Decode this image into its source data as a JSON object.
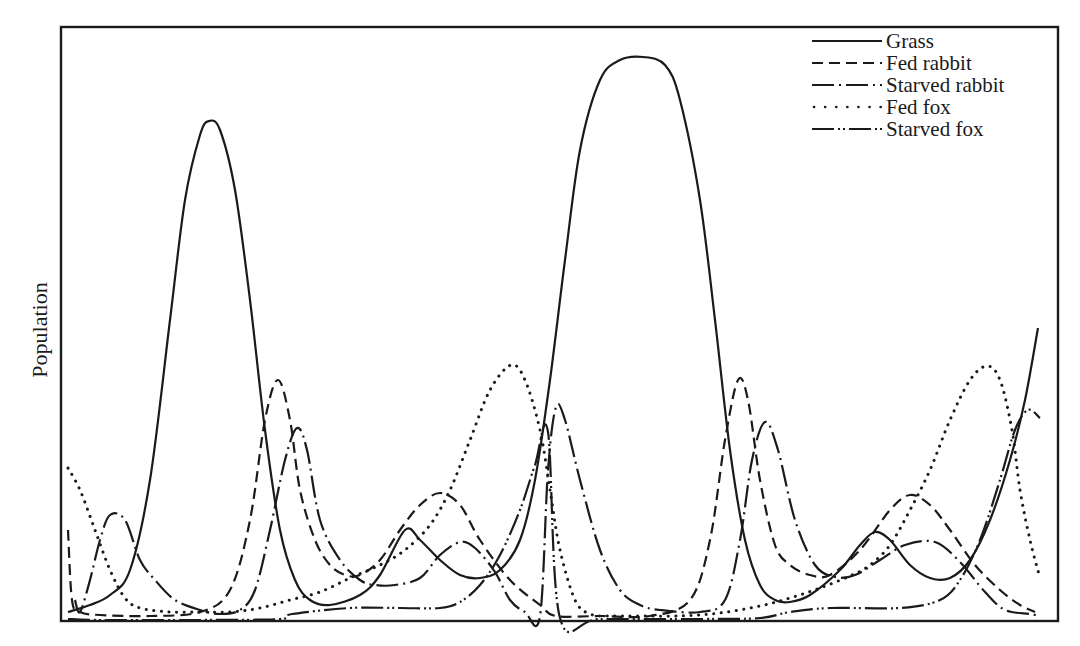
{
  "chart_data": {
    "type": "line",
    "title": "",
    "xlabel": "",
    "ylabel": "Population",
    "grid": false,
    "legend_position": "top-right",
    "frame_px": {
      "left": 61,
      "top": 27,
      "right": 1058,
      "bottom": 621
    },
    "baseline_px": 617,
    "note": "Points are [x_px, y_px] in image coordinates; population ∝ (617 - y_px). No axis ticks shown.",
    "series": [
      {
        "name": "Grass",
        "style": "solid",
        "points": [
          [
            68,
            612
          ],
          [
            90,
            605
          ],
          [
            110,
            595
          ],
          [
            130,
            570
          ],
          [
            150,
            480
          ],
          [
            170,
            320
          ],
          [
            185,
            200
          ],
          [
            200,
            135
          ],
          [
            209,
            121
          ],
          [
            220,
            130
          ],
          [
            235,
            190
          ],
          [
            250,
            300
          ],
          [
            265,
            430
          ],
          [
            280,
            530
          ],
          [
            295,
            580
          ],
          [
            310,
            600
          ],
          [
            330,
            605
          ],
          [
            360,
            595
          ],
          [
            380,
            575
          ],
          [
            405,
            530
          ],
          [
            420,
            540
          ],
          [
            440,
            560
          ],
          [
            460,
            575
          ],
          [
            480,
            578
          ],
          [
            500,
            570
          ],
          [
            520,
            540
          ],
          [
            535,
            480
          ],
          [
            550,
            380
          ],
          [
            565,
            260
          ],
          [
            580,
            150
          ],
          [
            600,
            80
          ],
          [
            620,
            60
          ],
          [
            643,
            57
          ],
          [
            665,
            65
          ],
          [
            680,
            100
          ],
          [
            700,
            200
          ],
          [
            715,
            320
          ],
          [
            730,
            450
          ],
          [
            745,
            540
          ],
          [
            760,
            585
          ],
          [
            775,
            600
          ],
          [
            790,
            602
          ],
          [
            810,
            595
          ],
          [
            840,
            570
          ],
          [
            860,
            545
          ],
          [
            875,
            532
          ],
          [
            890,
            540
          ],
          [
            910,
            565
          ],
          [
            930,
            578
          ],
          [
            950,
            578
          ],
          [
            970,
            560
          ],
          [
            990,
            520
          ],
          [
            1010,
            460
          ],
          [
            1025,
            400
          ],
          [
            1038,
            328
          ]
        ]
      },
      {
        "name": "Fed rabbit",
        "style": "dashed",
        "points": [
          [
            68,
            530
          ],
          [
            72,
            600
          ],
          [
            80,
            612
          ],
          [
            100,
            615
          ],
          [
            150,
            616
          ],
          [
            200,
            612
          ],
          [
            230,
            590
          ],
          [
            250,
            520
          ],
          [
            265,
            420
          ],
          [
            278,
            380
          ],
          [
            290,
            420
          ],
          [
            300,
            490
          ],
          [
            315,
            540
          ],
          [
            330,
            565
          ],
          [
            345,
            575
          ],
          [
            360,
            575
          ],
          [
            380,
            560
          ],
          [
            400,
            530
          ],
          [
            420,
            505
          ],
          [
            440,
            493
          ],
          [
            460,
            505
          ],
          [
            480,
            540
          ],
          [
            510,
            580
          ],
          [
            540,
            605
          ],
          [
            556,
            616
          ],
          [
            600,
            616
          ],
          [
            650,
            616
          ],
          [
            690,
            600
          ],
          [
            710,
            540
          ],
          [
            725,
            440
          ],
          [
            738,
            380
          ],
          [
            748,
            400
          ],
          [
            760,
            480
          ],
          [
            775,
            545
          ],
          [
            790,
            565
          ],
          [
            810,
            575
          ],
          [
            830,
            575
          ],
          [
            860,
            550
          ],
          [
            890,
            510
          ],
          [
            910,
            495
          ],
          [
            930,
            505
          ],
          [
            950,
            530
          ],
          [
            975,
            565
          ],
          [
            1000,
            590
          ],
          [
            1020,
            605
          ],
          [
            1035,
            612
          ]
        ]
      },
      {
        "name": "Starved rabbit",
        "style": "dash-dot",
        "points": [
          [
            75,
            600
          ],
          [
            80,
            612
          ],
          [
            90,
            580
          ],
          [
            100,
            540
          ],
          [
            110,
            515
          ],
          [
            125,
            520
          ],
          [
            140,
            560
          ],
          [
            155,
            580
          ],
          [
            175,
            600
          ],
          [
            200,
            610
          ],
          [
            220,
            614
          ],
          [
            240,
            610
          ],
          [
            255,
            590
          ],
          [
            270,
            530
          ],
          [
            285,
            460
          ],
          [
            297,
            428
          ],
          [
            307,
            450
          ],
          [
            320,
            520
          ],
          [
            340,
            560
          ],
          [
            360,
            580
          ],
          [
            375,
            585
          ],
          [
            395,
            585
          ],
          [
            420,
            578
          ],
          [
            440,
            555
          ],
          [
            460,
            542
          ],
          [
            475,
            548
          ],
          [
            495,
            572
          ],
          [
            510,
            600
          ],
          [
            525,
            612
          ],
          [
            540,
            616
          ],
          [
            548,
            470
          ],
          [
            556,
            407
          ],
          [
            565,
            420
          ],
          [
            580,
            480
          ],
          [
            600,
            550
          ],
          [
            620,
            590
          ],
          [
            640,
            605
          ],
          [
            660,
            610
          ],
          [
            700,
            612
          ],
          [
            725,
            600
          ],
          [
            740,
            540
          ],
          [
            752,
            460
          ],
          [
            765,
            422
          ],
          [
            778,
            450
          ],
          [
            795,
            520
          ],
          [
            815,
            565
          ],
          [
            835,
            577
          ],
          [
            855,
            575
          ],
          [
            880,
            560
          ],
          [
            905,
            545
          ],
          [
            935,
            542
          ],
          [
            960,
            562
          ],
          [
            985,
            592
          ],
          [
            1005,
            610
          ],
          [
            1030,
            614
          ],
          [
            1040,
            616
          ]
        ]
      },
      {
        "name": "Fed fox",
        "style": "dotted",
        "points": [
          [
            68,
            468
          ],
          [
            80,
            490
          ],
          [
            95,
            530
          ],
          [
            110,
            570
          ],
          [
            125,
            598
          ],
          [
            140,
            608
          ],
          [
            170,
            612
          ],
          [
            200,
            612
          ],
          [
            230,
            612
          ],
          [
            260,
            608
          ],
          [
            290,
            600
          ],
          [
            320,
            592
          ],
          [
            350,
            578
          ],
          [
            380,
            565
          ],
          [
            405,
            550
          ],
          [
            430,
            525
          ],
          [
            450,
            490
          ],
          [
            470,
            440
          ],
          [
            490,
            390
          ],
          [
            511,
            365
          ],
          [
            525,
            380
          ],
          [
            540,
            430
          ],
          [
            550,
            490
          ],
          [
            560,
            550
          ],
          [
            575,
            600
          ],
          [
            590,
            614
          ],
          [
            610,
            616
          ],
          [
            640,
            616
          ],
          [
            680,
            616
          ],
          [
            720,
            613
          ],
          [
            760,
            606
          ],
          [
            790,
            598
          ],
          [
            820,
            588
          ],
          [
            850,
            576
          ],
          [
            870,
            565
          ],
          [
            890,
            545
          ],
          [
            910,
            510
          ],
          [
            930,
            470
          ],
          [
            950,
            420
          ],
          [
            970,
            380
          ],
          [
            987,
            366
          ],
          [
            1000,
            380
          ],
          [
            1012,
            430
          ],
          [
            1020,
            490
          ],
          [
            1030,
            540
          ],
          [
            1040,
            578
          ]
        ]
      },
      {
        "name": "Starved fox",
        "style": "dash-dot-dot",
        "points": [
          [
            68,
            619
          ],
          [
            100,
            620
          ],
          [
            200,
            620
          ],
          [
            280,
            619
          ],
          [
            292,
            614
          ],
          [
            350,
            608
          ],
          [
            400,
            608
          ],
          [
            440,
            608
          ],
          [
            460,
            602
          ],
          [
            480,
            585
          ],
          [
            500,
            555
          ],
          [
            520,
            510
          ],
          [
            535,
            465
          ],
          [
            548,
            432
          ],
          [
            560,
            618
          ],
          [
            600,
            619
          ],
          [
            700,
            619
          ],
          [
            760,
            618
          ],
          [
            790,
            612
          ],
          [
            830,
            608
          ],
          [
            900,
            608
          ],
          [
            940,
            600
          ],
          [
            960,
            580
          ],
          [
            980,
            540
          ],
          [
            1000,
            480
          ],
          [
            1015,
            430
          ],
          [
            1028,
            410
          ],
          [
            1040,
            418
          ]
        ]
      }
    ]
  },
  "legend": {
    "items": [
      {
        "label": "Grass",
        "style": "solid"
      },
      {
        "label": "Fed rabbit",
        "style": "dashed"
      },
      {
        "label": "Starved rabbit",
        "style": "dash-dot"
      },
      {
        "label": "Fed fox",
        "style": "dotted"
      },
      {
        "label": "Starved fox",
        "style": "dash-dot-dot"
      }
    ]
  },
  "axes": {
    "ylabel": "Population"
  },
  "colors": {
    "ink": "#1a1a1a",
    "background": "#ffffff"
  }
}
